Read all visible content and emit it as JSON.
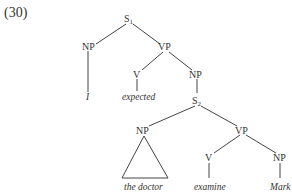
{
  "example_number": "(30)",
  "tree": {
    "root": {
      "label": "S",
      "subscript": "1"
    },
    "np_subject": {
      "label": "NP",
      "word": "I"
    },
    "vp_main": {
      "label": "VP"
    },
    "v_main": {
      "label": "V",
      "word": "expected"
    },
    "np_object": {
      "label": "NP"
    },
    "s_embedded": {
      "label": "S",
      "subscript": "2"
    },
    "np_embedded_subject": {
      "label": "NP",
      "word": "the doctor",
      "triangle": true
    },
    "vp_embedded": {
      "label": "VP"
    },
    "v_embedded": {
      "label": "V",
      "word": "examine"
    },
    "np_embedded_object": {
      "label": "NP",
      "word": "Mark"
    }
  }
}
